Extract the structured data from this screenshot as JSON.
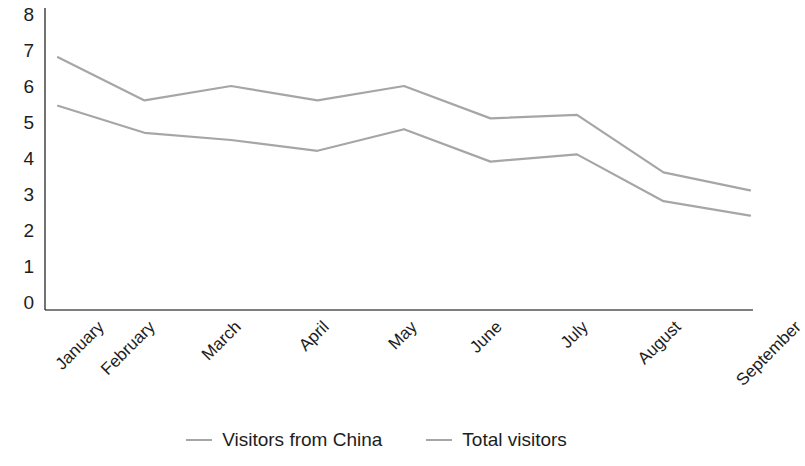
{
  "chart_data": {
    "type": "line",
    "title": "",
    "subtitle": "",
    "xlabel": "",
    "ylabel": "",
    "categories": [
      "January",
      "February",
      "March",
      "April",
      "May",
      "June",
      "July",
      "August",
      "September"
    ],
    "series": [
      {
        "name": "Visitors from China",
        "color": "#a6a6a6",
        "values": [
          5.45,
          4.7,
          4.5,
          4.2,
          4.8,
          3.9,
          4.1,
          2.8,
          2.4
        ]
      },
      {
        "name": "Total visitors",
        "color": "#a6a6a6",
        "values": [
          6.8,
          5.6,
          6.0,
          5.6,
          6.0,
          5.1,
          5.2,
          3.6,
          3.1
        ]
      }
    ],
    "ylim": [
      0,
      8
    ],
    "yticks": [
      8,
      7,
      6,
      5,
      4,
      3,
      2,
      1,
      0
    ],
    "ytick_labels": [
      "8",
      "7",
      "6",
      "5",
      "4",
      "3",
      "2",
      "1",
      "0"
    ],
    "grid": false,
    "legend_position": "bottom",
    "axis_line_color": "#000000",
    "background": "#ffffff"
  },
  "legend": {
    "items": [
      {
        "label": "Visitors from China",
        "swatch": "line-swatch-icon"
      },
      {
        "label": "Total visitors",
        "swatch": "line-swatch-icon"
      }
    ]
  }
}
